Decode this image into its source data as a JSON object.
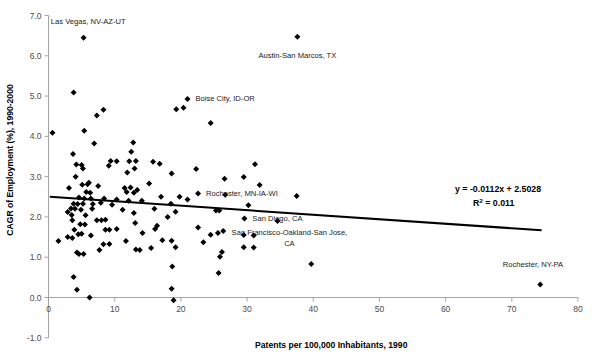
{
  "chart_data": {
    "type": "scatter",
    "title": "",
    "xlabel": "Patents per 100,000 Inhabitants, 1990",
    "ylabel": "CAGR of Employment (%), 1990-2000",
    "xlim": [
      0,
      80
    ],
    "ylim": [
      -1.0,
      7.0
    ],
    "xticks": [
      "0",
      "10",
      "20",
      "30",
      "40",
      "50",
      "60",
      "70",
      "80"
    ],
    "xtick_values": [
      0,
      10,
      20,
      30,
      40,
      50,
      60,
      70,
      80
    ],
    "yticks": [
      "-1.0",
      "0.0",
      "1.0",
      "2.0",
      "3.0",
      "4.0",
      "5.0",
      "6.0",
      "7.0"
    ],
    "ytick_values": [
      -1.0,
      0.0,
      1.0,
      2.0,
      3.0,
      4.0,
      5.0,
      6.0,
      7.0
    ],
    "grid": false,
    "legend": false,
    "marker": "diamond",
    "marker_color": "#000000",
    "trendline": {
      "equation_label": "y = -0.0112x + 2.5028",
      "r2_label": "R",
      "r2_exponent": "2",
      "r2_value": "= 0.011",
      "slope": -0.0112,
      "intercept": 2.5028,
      "r_squared": 0.011,
      "x_start": 0.2,
      "x_end": 74.5,
      "color": "#000000"
    },
    "annotations": [
      {
        "text": "Las Vegas, NV-AZ-UT",
        "x": 5.3,
        "y": 6.45,
        "label_x": 6.0,
        "label_y": 6.86,
        "anchor": "middle"
      },
      {
        "text": "Austin-San Marcos, TX",
        "x": 37.6,
        "y": 6.47,
        "label_x": 37.6,
        "label_y": 6.02,
        "anchor": "middle"
      },
      {
        "text": "Boise City, ID-OR",
        "x": 21.0,
        "y": 4.93,
        "label_x": 22.2,
        "label_y": 4.93,
        "anchor": "start"
      },
      {
        "text": "Rochester, MN-IA-WI",
        "x": 22.6,
        "y": 2.58,
        "label_x": 23.8,
        "label_y": 2.58,
        "anchor": "start"
      },
      {
        "text": "San Diego, CA",
        "x": 29.6,
        "y": 1.96,
        "label_x": 30.8,
        "label_y": 1.96,
        "anchor": "start"
      },
      {
        "text": "San Francisco-Oakland-San Jose,",
        "x": 34.6,
        "y": 1.9,
        "label_x": 36.4,
        "label_y": 1.62,
        "anchor": "middle"
      },
      {
        "text": "CA",
        "x": null,
        "y": null,
        "label_x": 36.4,
        "label_y": 1.34,
        "anchor": "middle"
      },
      {
        "text": "Rochester, NY-PA",
        "x": 74.3,
        "y": 0.32,
        "label_x": 73.2,
        "label_y": 0.82,
        "anchor": "middle"
      }
    ],
    "points": [
      {
        "x": 0.6,
        "y": 4.09
      },
      {
        "x": 5.3,
        "y": 6.45
      },
      {
        "x": 37.6,
        "y": 6.47
      },
      {
        "x": 3.8,
        "y": 5.09
      },
      {
        "x": 21.0,
        "y": 4.93
      },
      {
        "x": 19.3,
        "y": 4.67
      },
      {
        "x": 20.4,
        "y": 4.71
      },
      {
        "x": 8.3,
        "y": 4.66
      },
      {
        "x": 7.3,
        "y": 4.52
      },
      {
        "x": 24.5,
        "y": 4.33
      },
      {
        "x": 5.4,
        "y": 4.14
      },
      {
        "x": 6.9,
        "y": 3.82
      },
      {
        "x": 12.8,
        "y": 3.85
      },
      {
        "x": 3.7,
        "y": 3.56
      },
      {
        "x": 12.5,
        "y": 3.62
      },
      {
        "x": 31.2,
        "y": 3.31
      },
      {
        "x": 15.8,
        "y": 3.37
      },
      {
        "x": 16.8,
        "y": 3.32
      },
      {
        "x": 9.4,
        "y": 3.39
      },
      {
        "x": 10.3,
        "y": 3.38
      },
      {
        "x": 12.2,
        "y": 3.38
      },
      {
        "x": 13.2,
        "y": 3.39
      },
      {
        "x": 22.3,
        "y": 3.19
      },
      {
        "x": 18.6,
        "y": 3.08
      },
      {
        "x": 4.2,
        "y": 3.3
      },
      {
        "x": 5.0,
        "y": 3.29
      },
      {
        "x": 9.1,
        "y": 3.27
      },
      {
        "x": 13.0,
        "y": 3.2
      },
      {
        "x": 5.2,
        "y": 3.2
      },
      {
        "x": 11.9,
        "y": 3.1
      },
      {
        "x": 4.1,
        "y": 3.0
      },
      {
        "x": 31.9,
        "y": 2.79
      },
      {
        "x": 29.5,
        "y": 2.99
      },
      {
        "x": 26.6,
        "y": 2.95
      },
      {
        "x": 15.2,
        "y": 2.83
      },
      {
        "x": 5.1,
        "y": 2.8
      },
      {
        "x": 5.9,
        "y": 2.81
      },
      {
        "x": 6.1,
        "y": 2.85
      },
      {
        "x": 11.5,
        "y": 2.72
      },
      {
        "x": 12.4,
        "y": 2.73
      },
      {
        "x": 13.4,
        "y": 2.67
      },
      {
        "x": 3.1,
        "y": 2.72
      },
      {
        "x": 7.5,
        "y": 2.77
      },
      {
        "x": 6.3,
        "y": 2.6
      },
      {
        "x": 5.7,
        "y": 2.62
      },
      {
        "x": 11.8,
        "y": 2.62
      },
      {
        "x": 12.9,
        "y": 2.6
      },
      {
        "x": 22.6,
        "y": 2.58
      },
      {
        "x": 26.7,
        "y": 2.55
      },
      {
        "x": 37.5,
        "y": 2.52
      },
      {
        "x": 19.8,
        "y": 2.5
      },
      {
        "x": 17.0,
        "y": 2.5
      },
      {
        "x": 4.6,
        "y": 2.48
      },
      {
        "x": 5.4,
        "y": 2.46
      },
      {
        "x": 6.4,
        "y": 2.46
      },
      {
        "x": 8.4,
        "y": 2.46
      },
      {
        "x": 10.3,
        "y": 2.43
      },
      {
        "x": 12.1,
        "y": 2.4
      },
      {
        "x": 14.1,
        "y": 2.4
      },
      {
        "x": 21.0,
        "y": 2.43
      },
      {
        "x": 3.8,
        "y": 2.33
      },
      {
        "x": 4.4,
        "y": 2.32
      },
      {
        "x": 5.2,
        "y": 2.33
      },
      {
        "x": 6.7,
        "y": 2.32
      },
      {
        "x": 7.9,
        "y": 2.35
      },
      {
        "x": 9.6,
        "y": 2.3
      },
      {
        "x": 18.5,
        "y": 2.33
      },
      {
        "x": 30.2,
        "y": 2.29
      },
      {
        "x": 3.4,
        "y": 2.21
      },
      {
        "x": 4.0,
        "y": 2.2
      },
      {
        "x": 4.9,
        "y": 2.18
      },
      {
        "x": 6.6,
        "y": 2.2
      },
      {
        "x": 11.2,
        "y": 2.18
      },
      {
        "x": 16.0,
        "y": 2.2
      },
      {
        "x": 19.2,
        "y": 2.13
      },
      {
        "x": 25.3,
        "y": 2.16
      },
      {
        "x": 25.8,
        "y": 2.16
      },
      {
        "x": 2.9,
        "y": 2.12
      },
      {
        "x": 3.5,
        "y": 2.05
      },
      {
        "x": 5.6,
        "y": 2.04
      },
      {
        "x": 12.9,
        "y": 2.1
      },
      {
        "x": 18.0,
        "y": 2.0
      },
      {
        "x": 29.6,
        "y": 1.96
      },
      {
        "x": 34.6,
        "y": 1.9
      },
      {
        "x": 3.6,
        "y": 1.92
      },
      {
        "x": 7.3,
        "y": 1.92
      },
      {
        "x": 8.0,
        "y": 1.92
      },
      {
        "x": 8.6,
        "y": 1.93
      },
      {
        "x": 13.1,
        "y": 1.85
      },
      {
        "x": 4.8,
        "y": 1.82
      },
      {
        "x": 5.5,
        "y": 1.81
      },
      {
        "x": 16.4,
        "y": 1.78
      },
      {
        "x": 22.6,
        "y": 1.74
      },
      {
        "x": 3.9,
        "y": 1.68
      },
      {
        "x": 8.6,
        "y": 1.68
      },
      {
        "x": 9.2,
        "y": 1.68
      },
      {
        "x": 10.3,
        "y": 1.7
      },
      {
        "x": 14.2,
        "y": 1.6
      },
      {
        "x": 16.1,
        "y": 1.7
      },
      {
        "x": 25.6,
        "y": 1.6
      },
      {
        "x": 26.4,
        "y": 1.65
      },
      {
        "x": 24.5,
        "y": 1.56
      },
      {
        "x": 29.5,
        "y": 1.55
      },
      {
        "x": 31.0,
        "y": 1.54
      },
      {
        "x": 1.5,
        "y": 1.4
      },
      {
        "x": 2.9,
        "y": 1.5
      },
      {
        "x": 3.6,
        "y": 1.48
      },
      {
        "x": 4.5,
        "y": 1.57
      },
      {
        "x": 5.0,
        "y": 1.58
      },
      {
        "x": 6.4,
        "y": 1.54
      },
      {
        "x": 17.2,
        "y": 1.42
      },
      {
        "x": 18.6,
        "y": 1.41
      },
      {
        "x": 11.7,
        "y": 1.4
      },
      {
        "x": 23.4,
        "y": 1.37
      },
      {
        "x": 8.3,
        "y": 1.32
      },
      {
        "x": 9.2,
        "y": 1.33
      },
      {
        "x": 13.2,
        "y": 1.19
      },
      {
        "x": 13.8,
        "y": 1.18
      },
      {
        "x": 19.2,
        "y": 1.25
      },
      {
        "x": 29.5,
        "y": 1.25
      },
      {
        "x": 31.0,
        "y": 1.24
      },
      {
        "x": 15.5,
        "y": 1.23
      },
      {
        "x": 7.7,
        "y": 1.18
      },
      {
        "x": 4.3,
        "y": 1.12
      },
      {
        "x": 4.6,
        "y": 1.08
      },
      {
        "x": 5.3,
        "y": 1.08
      },
      {
        "x": 26.2,
        "y": 1.13
      },
      {
        "x": 25.9,
        "y": 1.01
      },
      {
        "x": 39.7,
        "y": 0.83
      },
      {
        "x": 18.7,
        "y": 0.77
      },
      {
        "x": 25.7,
        "y": 0.61
      },
      {
        "x": 3.8,
        "y": 0.51
      },
      {
        "x": 74.3,
        "y": 0.32
      },
      {
        "x": 4.3,
        "y": 0.19
      },
      {
        "x": 18.6,
        "y": 0.22
      },
      {
        "x": 6.2,
        "y": 0.0
      },
      {
        "x": 18.9,
        "y": -0.07
      }
    ]
  }
}
